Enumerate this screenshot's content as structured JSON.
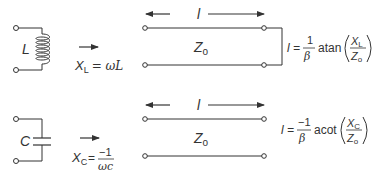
{
  "top": {
    "component_label": "L",
    "reactance_symbol": "X",
    "reactance_sub": "L",
    "reactance_expr": "= ωL",
    "length_label": "l",
    "impedance_symbol": "Z",
    "impedance_sub": "o",
    "termination": "short",
    "formula": {
      "lhs": "l =",
      "frac_num": "1",
      "frac_den": "β",
      "func": "atan",
      "inner_num_symbol": "X",
      "inner_num_sub": "L",
      "inner_den_symbol": "Z",
      "inner_den_sub": "o"
    }
  },
  "bottom": {
    "component_label": "C",
    "reactance_symbol": "X",
    "reactance_sub": "C",
    "reactance_eq": "=",
    "reactance_num": "−1",
    "reactance_den": "ωc",
    "length_label": "l",
    "impedance_symbol": "Z",
    "impedance_sub": "o",
    "termination": "open",
    "formula": {
      "lhs": "l =",
      "frac_num": "−1",
      "frac_den": "β",
      "func": "acot",
      "inner_num_symbol": "X",
      "inner_num_sub": "C",
      "inner_den_symbol": "Z",
      "inner_den_sub": "o"
    }
  }
}
